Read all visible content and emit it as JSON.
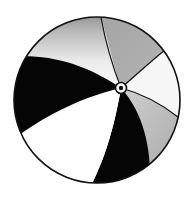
{
  "image": {
    "subject": "beach ball",
    "style": "black and white / grayscale illustration",
    "alt_text": "Beach ball"
  },
  "colors": {
    "background": "#ffffff",
    "outline": "#111111",
    "black_panel": "#050505",
    "gray_panel": "#a9a9a9",
    "light_panel": "#f4f4f4",
    "white_panel": "#ffffff"
  },
  "ball": {
    "center_x": 97,
    "center_y": 100,
    "radius": 83,
    "hub_x": 121,
    "hub_y": 88,
    "panels": [
      {
        "name": "top-left-gradient",
        "fill": "light-gray-gradient"
      },
      {
        "name": "top-right",
        "fill": "gray"
      },
      {
        "name": "right-upper",
        "fill": "white"
      },
      {
        "name": "right-lower",
        "fill": "gray"
      },
      {
        "name": "bottom-center",
        "fill": "black"
      },
      {
        "name": "bottom-left",
        "fill": "white"
      },
      {
        "name": "left",
        "fill": "black"
      }
    ]
  }
}
